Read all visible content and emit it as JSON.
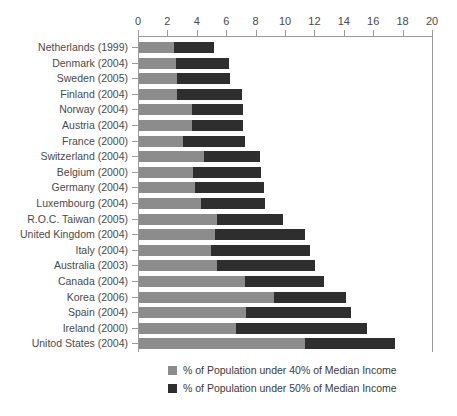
{
  "chart_data": {
    "type": "bar",
    "orientation": "horizontal",
    "stacked": true,
    "title": "",
    "subtitle": "",
    "xlabel": "",
    "ylabel": "",
    "xlim": [
      0,
      20
    ],
    "xticks": [
      0,
      2,
      4,
      6,
      8,
      10,
      12,
      14,
      16,
      18,
      20
    ],
    "xtick_labels": [
      "0",
      "2",
      "4",
      "6",
      "8",
      "10",
      "12",
      "14",
      "16",
      "18",
      "20"
    ],
    "grid": false,
    "legend_position": "bottom",
    "categories": [
      "Netherlands (1999)",
      "Denmark (2004)",
      "Sweden (2005)",
      "Finland (2004)",
      "Norway (2004)",
      "Austria (2004)",
      "France (2000)",
      "Switzerland (2004)",
      "Belgium (2000)",
      "Germany (2004)",
      "Luxembourg (2004)",
      "R.O.C. Taiwan (2005)",
      "United Kingdom (2004)",
      "Italy (2004)",
      "Australia (2003)",
      "Canada (2004)",
      "Korea (2006)",
      "Spain (2004)",
      "Ireland (2000)",
      "Unitod States (2004)"
    ],
    "series": [
      {
        "name": "% of Population under 40% of Median Income",
        "color": "#8c8c8c",
        "values": [
          2.4,
          2.5,
          2.6,
          2.6,
          3.6,
          3.6,
          3.0,
          4.4,
          3.7,
          3.8,
          4.2,
          5.3,
          5.2,
          4.9,
          5.3,
          7.2,
          9.2,
          7.3,
          6.6,
          11.3
        ]
      },
      {
        "name": "% of Population under 50% of Median Income",
        "color": "#2e2e2e",
        "values": [
          5.1,
          6.1,
          6.2,
          7.0,
          7.1,
          7.1,
          7.2,
          8.2,
          8.3,
          8.5,
          8.6,
          9.8,
          11.3,
          11.6,
          12.0,
          12.6,
          14.1,
          14.4,
          15.5,
          17.4
        ]
      }
    ],
    "legend": [
      {
        "label": "% of Population under 40% of Median Income",
        "color": "#8c8c8c",
        "swatch": "light"
      },
      {
        "label": "% of Population under 50% of Median Income",
        "color": "#2e2e2e",
        "swatch": "dark"
      }
    ]
  },
  "colors": {
    "light_segment": "#8c8c8c",
    "dark_segment": "#2e2e2e",
    "axis": "#9a9a9a",
    "text": "#3a3a3a",
    "background": "#ffffff"
  }
}
